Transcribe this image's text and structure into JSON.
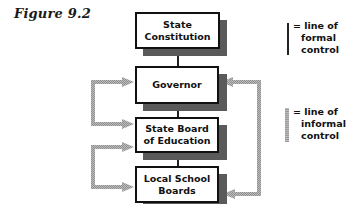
{
  "figure": {
    "title": "Figure 9.2"
  },
  "boxes": [
    {
      "id": "state-constitution",
      "label": "State\nConstitution"
    },
    {
      "id": "governor",
      "label": "Governor"
    },
    {
      "id": "state-board",
      "label": "State Board\nof Education"
    },
    {
      "id": "local-school-boards",
      "label": "Local School\nBoards"
    }
  ],
  "legend": {
    "formal": {
      "line1": "= line of",
      "line2": "formal",
      "line3": "control"
    },
    "informal": {
      "line1": "= line of",
      "line2": "informal",
      "line3": "control"
    }
  },
  "edges": {
    "formal": [
      {
        "from": "State Constitution",
        "to": "Governor"
      },
      {
        "from": "Governor",
        "to": "State Board of Education"
      },
      {
        "from": "State Board of Education",
        "to": "Local School Boards"
      }
    ],
    "informal": [
      {
        "from": "State Board of Education",
        "to": "Governor",
        "side": "left"
      },
      {
        "from": "Governor",
        "to": "State Board of Education",
        "side": "left"
      },
      {
        "from": "Local School Boards",
        "to": "State Board of Education",
        "side": "left"
      },
      {
        "from": "State Board of Education",
        "to": "Local School Boards",
        "side": "left"
      },
      {
        "from": "Local School Boards",
        "to": "Governor",
        "side": "right"
      },
      {
        "from": "Governor",
        "to": "Local School Boards",
        "side": "right"
      }
    ]
  },
  "colors": {
    "formal_line": "#222222",
    "informal_line": "#a8a8a8",
    "box_border": "#111111",
    "box_shadow": "#5a5a5a"
  }
}
